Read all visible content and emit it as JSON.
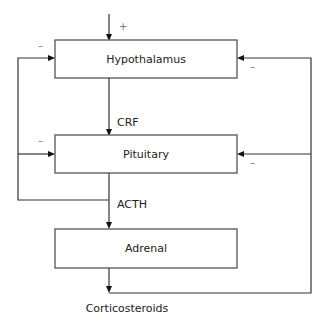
{
  "diagram": {
    "nodes": [
      {
        "id": "hypothalamus",
        "label": "Hypothalamus"
      },
      {
        "id": "pituitary",
        "label": "Pituitary"
      },
      {
        "id": "adrenal",
        "label": "Adrenal"
      }
    ],
    "edge_labels": {
      "crf": "CRF",
      "acth": "ACTH",
      "corticosteroids": "Corticosteroids"
    },
    "signs": {
      "input_positive": "+",
      "hypothalamus_left_negative": "–",
      "hypothalamus_right_negative": "–",
      "pituitary_left_negative": "–",
      "pituitary_right_negative": "–"
    }
  }
}
